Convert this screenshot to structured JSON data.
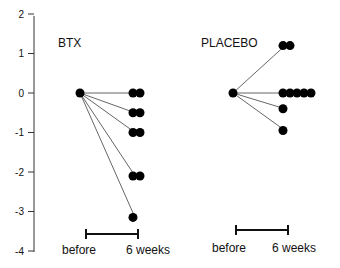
{
  "chart_data": {
    "type": "scatter",
    "title": "",
    "xlabel": "",
    "ylabel": "",
    "ylim": [
      -4,
      2
    ],
    "yticks": [
      "2",
      "1",
      "0",
      "-1",
      "-2",
      "-3",
      "-4"
    ],
    "grid": false,
    "legend": null,
    "groups": [
      {
        "name": "BTX",
        "categories": [
          "before",
          "6 weeks"
        ],
        "before": 0,
        "after_values": [
          0,
          0,
          -0.5,
          -0.5,
          -1,
          -1,
          -2.1,
          -2.1,
          -3.15
        ],
        "lines_to": [
          0,
          -0.5,
          -1,
          -2.1,
          -3.15
        ]
      },
      {
        "name": "PLACEBO",
        "categories": [
          "before",
          "6 weeks"
        ],
        "before": 0,
        "after_values": [
          1.2,
          1.2,
          0,
          0,
          0,
          0,
          0,
          -0.4,
          -0.95
        ],
        "lines_to": [
          1.2,
          0,
          -0.4,
          -0.95
        ]
      }
    ]
  },
  "labels": {
    "btx": "BTX",
    "placebo": "PLACEBO",
    "before": "before",
    "after": "6 weeks"
  }
}
